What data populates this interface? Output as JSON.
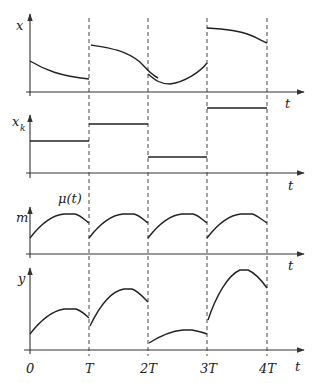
{
  "diagram": {
    "type": "timing-diagram",
    "colors": {
      "ink": "#222222",
      "background": "#ffffff"
    },
    "time_axis": {
      "label": "t",
      "ticks": [
        "0",
        "T",
        "2T",
        "3T",
        "4T"
      ]
    },
    "panels": [
      {
        "id": "x",
        "y_label": "x",
        "x_label": "t",
        "description": "continuous signal x(t), piecewise decreasing/varying with jumps at sampling instants"
      },
      {
        "id": "xk",
        "y_label": "x",
        "y_label_sub": "k",
        "x_label": "t",
        "description": "sampled and held values x_k, step levels per interval",
        "levels": [
          "medium",
          "high",
          "low",
          "highest"
        ]
      },
      {
        "id": "m",
        "y_label": "m",
        "x_label": "t",
        "curve_label": "μ(t)",
        "description": "periodic arch-shaped modulating function repeated each period T"
      },
      {
        "id": "y",
        "y_label": "y",
        "x_label": "t",
        "description": "output y = x_k · μ(t), arches scaled by held values"
      }
    ]
  }
}
